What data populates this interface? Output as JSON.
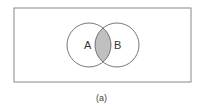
{
  "diagram": {
    "type": "venn",
    "universe": {
      "x": 14,
      "y": 8,
      "width": 177,
      "height": 74,
      "stroke": "#888888"
    },
    "sets": [
      {
        "id": "A",
        "label": "A",
        "cx": 89,
        "cy": 45,
        "r": 22
      },
      {
        "id": "B",
        "label": "B",
        "cx": 117,
        "cy": 45,
        "r": 22
      }
    ],
    "shaded_region": "A ∩ B",
    "shade_color": "#c0c0c0",
    "caption": "(a)"
  }
}
